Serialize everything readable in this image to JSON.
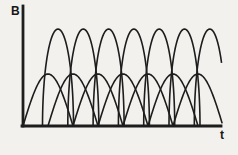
{
  "figure": {
    "ylabel": "B",
    "xlabel": "t",
    "background": "#f2f1ee",
    "ink": "#1d1d1d"
  },
  "chart_data": {
    "type": "line",
    "title": "",
    "xlabel": "t",
    "ylabel": "B",
    "axes": {
      "x_start_px": 23,
      "x_end_px": 221,
      "baseline_y_px": 126,
      "yaxis_top_px": 6,
      "axis_stroke_px": 2.8
    },
    "grid": false,
    "legend": null,
    "series": [
      {
        "name": "wide-half-sine-pulses",
        "shape": "half-sine",
        "count": 7,
        "first_peak_x": 48,
        "peak_spacing": 25,
        "width": 50,
        "height": 52
      },
      {
        "name": "tall-narrow-pulses",
        "shape": "half-ellipse",
        "count": 7,
        "first_peak_x": 58,
        "peak_spacing": 25.3,
        "width": 31,
        "height": 97
      }
    ],
    "curve_stroke_px": 1.6
  }
}
